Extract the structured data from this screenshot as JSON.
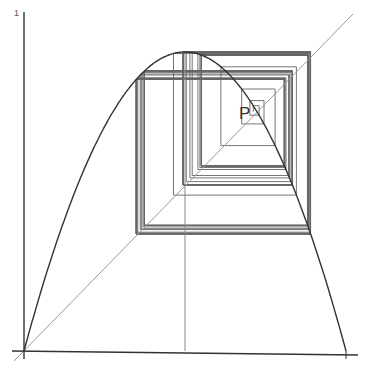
{
  "chart_data": {
    "type": "line",
    "title": "",
    "map": {
      "r": 3.56
    },
    "orbit": {
      "x0": 0.712,
      "iterations": 90
    },
    "fixed_point_label": "P",
    "y_tick_label": "1",
    "xlim": [
      0,
      1
    ],
    "ylim": [
      0,
      1
    ],
    "vertical_guide_x": 0.5,
    "colors": {
      "axes": "#333333",
      "curve": "#333333",
      "diagonal": "#999999",
      "cobweb": "#666666",
      "guide": "#888888"
    }
  }
}
